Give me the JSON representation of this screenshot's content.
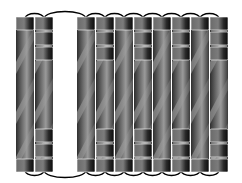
{
  "diagram": {
    "colors": {
      "background": "#ffffff",
      "loop": "#000000",
      "rod_dark": "#3a3a3a",
      "rod_mid": "#8a8a8a",
      "rod_light": "#bdbdbd",
      "cap_dark": "#1a1a1a",
      "cap_light": "#7a7a7a"
    },
    "rod_top": 17,
    "rod_bottom": 172,
    "rod_width": 18,
    "rods": [
      {
        "id": 1,
        "x": 16,
        "segmented": false
      },
      {
        "id": 2,
        "x": 35,
        "segmented": true
      },
      {
        "id": 3,
        "x": 77,
        "segmented": false
      },
      {
        "id": 4,
        "x": 96,
        "segmented": true
      },
      {
        "id": 5,
        "x": 115,
        "segmented": false
      },
      {
        "id": 6,
        "x": 134,
        "segmented": true
      },
      {
        "id": 7,
        "x": 153,
        "segmented": false
      },
      {
        "id": 8,
        "x": 172,
        "segmented": true
      },
      {
        "id": 9,
        "x": 191,
        "segmented": false
      },
      {
        "id": 10,
        "x": 210,
        "segmented": true
      }
    ],
    "top_loops": [
      [
        1,
        2
      ],
      [
        2,
        3
      ],
      [
        3,
        4
      ],
      [
        4,
        5
      ],
      [
        5,
        6
      ],
      [
        6,
        7
      ],
      [
        7,
        8
      ],
      [
        8,
        9
      ],
      [
        9,
        10
      ]
    ],
    "bottom_loops": [
      [
        1,
        2
      ],
      [
        2,
        3
      ],
      [
        3,
        4
      ],
      [
        4,
        5
      ],
      [
        5,
        6
      ],
      [
        6,
        7
      ],
      [
        7,
        8
      ],
      [
        8,
        9
      ],
      [
        9,
        10
      ]
    ]
  }
}
